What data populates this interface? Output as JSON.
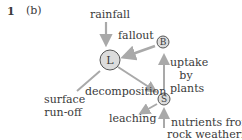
{
  "header": {
    "question_number": "1",
    "part": "(b)"
  },
  "nodes": {
    "litter": "L",
    "biomass": "B",
    "soil": "S"
  },
  "labels": {
    "rainfall": "rainfall",
    "fallout": "fallout",
    "uptake_line1": "uptake",
    "uptake_line2": "by",
    "uptake_line3": "plants",
    "decomposition": "decomposition",
    "surface_line1": "surface",
    "surface_line2": "run-off",
    "leaching": "leaching",
    "nutrients_line1": "nutrients from",
    "nutrients_line2": "rock weathering"
  },
  "colors": {
    "arrow": "#a9a9a9",
    "node_fill": "#dcdcdc",
    "node_stroke": "#555555",
    "text": "#3a3a3a"
  }
}
